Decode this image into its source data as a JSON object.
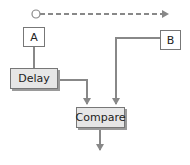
{
  "diagram": {
    "nodes": {
      "a": {
        "label": "A"
      },
      "b": {
        "label": "B"
      },
      "delay": {
        "label": "Delay"
      },
      "compare": {
        "label": "Compare"
      }
    },
    "edges": [
      {
        "from": "timeline-start",
        "to": "timeline-end",
        "style": "dashed"
      },
      {
        "from": "A",
        "to": "Delay",
        "style": "solid"
      },
      {
        "from": "Delay",
        "to": "Compare",
        "style": "solid-arrow"
      },
      {
        "from": "B",
        "to": "Compare",
        "style": "solid-arrow"
      },
      {
        "from": "Compare",
        "to": "output",
        "style": "solid-arrow"
      }
    ],
    "colors": {
      "line": "#888888",
      "box_border": "#777777",
      "shaded_fill": "#e6e6e6"
    }
  }
}
